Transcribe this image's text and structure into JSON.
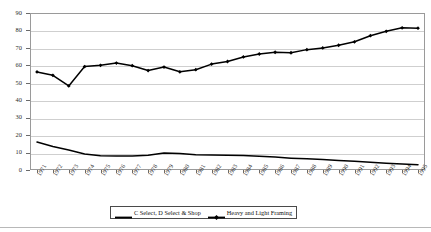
{
  "chart_data": {
    "type": "line",
    "title": "",
    "subtitle": "",
    "xlabel": "",
    "ylabel": "Percentage of Total Production",
    "ylim": [
      0,
      90
    ],
    "y_ticks": [
      0,
      10,
      20,
      30,
      40,
      50,
      60,
      70,
      80,
      90
    ],
    "grid": "horizontal",
    "legend_position": "bottom",
    "x": [
      1971,
      1972,
      1973,
      1974,
      1975,
      1976,
      1977,
      1978,
      1979,
      1980,
      1981,
      1982,
      1983,
      1984,
      1985,
      1986,
      1987,
      1988,
      1989,
      1990,
      1991,
      1992,
      1993,
      1994,
      1995
    ],
    "categories": [
      "1971",
      "1972",
      "1973",
      "1974",
      "1975",
      "1976",
      "1977",
      "1978",
      "1979",
      "1980",
      "1981",
      "1982",
      "1983",
      "1984",
      "1985",
      "1986",
      "1987",
      "1988",
      "1989",
      "1990",
      "1991",
      "1992",
      "1993",
      "1994",
      "1995"
    ],
    "series": [
      {
        "name": "C Select, D Select & Shop",
        "marker": "none",
        "color": "#000000",
        "values": [
          16.0,
          13.5,
          11.5,
          9.2,
          8.2,
          8.0,
          8.0,
          8.4,
          9.8,
          9.5,
          8.8,
          8.6,
          8.5,
          8.3,
          7.9,
          7.4,
          6.8,
          6.4,
          6.0,
          5.5,
          5.0,
          4.4,
          3.9,
          3.4,
          3.0
        ]
      },
      {
        "name": "Heavy and Light Framing",
        "marker": "diamond",
        "color": "#000000",
        "values": [
          56.2,
          54.3,
          48.2,
          59.3,
          60.0,
          61.3,
          59.8,
          57.0,
          59.0,
          56.3,
          57.5,
          60.7,
          62.2,
          64.8,
          66.5,
          67.5,
          67.2,
          69.0,
          70.0,
          71.5,
          73.5,
          77.0,
          79.5,
          81.5,
          81.3
        ]
      }
    ]
  },
  "legend": {
    "entries": [
      {
        "label": "C Select, D Select & Shop",
        "marker": "none"
      },
      {
        "label": "Heavy and Light Framing",
        "marker": "diamond"
      }
    ]
  },
  "axis": {
    "y_title": "Percentage of Total Production"
  }
}
